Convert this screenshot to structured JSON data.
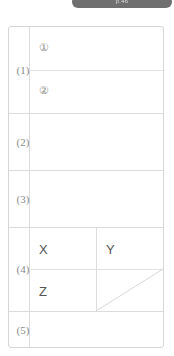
{
  "banner": {
    "text": "p.46",
    "pill_color": "#6f6f6f",
    "text_color": "#e8e8e8"
  },
  "worksheet": {
    "border_color": "#d6d6d6",
    "grid_line_color": "#dcdcdc",
    "label_text_color": "#8a8a8a",
    "mark_text_color": "#8d8d8d",
    "letter_text_color": "#555555",
    "background": "#ffffff",
    "rows": [
      {
        "label": "(1)",
        "subrows": [
          {
            "mark": "①"
          },
          {
            "mark": "②"
          }
        ]
      },
      {
        "label": "(2)",
        "subrows": [
          {
            "mark": ""
          }
        ]
      },
      {
        "label": "(3)",
        "subrows": [
          {
            "mark": ""
          }
        ]
      },
      {
        "label": "(4)",
        "subrows": [
          {
            "left": "X",
            "right": "Y"
          },
          {
            "left": "Z",
            "right": ""
          }
        ]
      },
      {
        "label": "(5)",
        "subrows": [
          {
            "mark": ""
          }
        ]
      }
    ]
  }
}
